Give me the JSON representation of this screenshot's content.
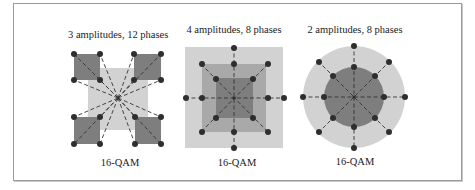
{
  "figure": {
    "panels": [
      {
        "id": "left",
        "title": "3 amplitudes, 12 phases",
        "caption": "16-QAM",
        "shape": "square-clusters"
      },
      {
        "id": "middle",
        "title": "4 amplitudes, 8 phases",
        "caption": "16-QAM",
        "shape": "nested-squares"
      },
      {
        "id": "right",
        "title": "2 amplitudes, 8 phases",
        "caption": "16-QAM",
        "shape": "concentric-circles"
      }
    ],
    "colors": {
      "light_fill": "#d2d2d2",
      "mid_fill": "#a9a9a9",
      "dark_fill": "#7e7e7e",
      "point": "#2e2e2e",
      "dash": "#333333",
      "frame": "#9a9a9a"
    }
  }
}
